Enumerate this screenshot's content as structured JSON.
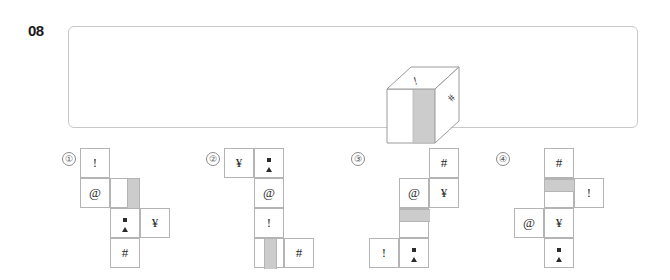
{
  "question": {
    "number": "08",
    "type": "cube-net-matching"
  },
  "prompt": {
    "frame": {
      "border_color": "#c8c8c8"
    },
    "cube": {
      "name": "isometric-cube",
      "top_face_symbol": "!",
      "right_face_symbol": "#",
      "front_face_symbol": "",
      "front_face_band_color": "#cccccc",
      "outline_color": "#9a9a9a"
    }
  },
  "options": [
    {
      "label": "①",
      "id": "option-1",
      "cells": [
        {
          "row": 0,
          "col": 0,
          "symbol": "!"
        },
        {
          "row": 1,
          "col": 0,
          "symbol": "@"
        },
        {
          "row": 1,
          "col": 1,
          "symbol": "",
          "band": "vert-right"
        },
        {
          "row": 2,
          "col": 1,
          "symbol": "dotbar"
        },
        {
          "row": 2,
          "col": 2,
          "symbol": "¥"
        },
        {
          "row": 3,
          "col": 1,
          "symbol": "#"
        }
      ]
    },
    {
      "label": "②",
      "id": "option-2",
      "cells": [
        {
          "row": 0,
          "col": 0,
          "symbol": "¥"
        },
        {
          "row": 0,
          "col": 1,
          "symbol": "dotbar"
        },
        {
          "row": 1,
          "col": 1,
          "symbol": "@"
        },
        {
          "row": 2,
          "col": 1,
          "symbol": "!"
        },
        {
          "row": 3,
          "col": 1,
          "symbol": "",
          "band": "vert-mid"
        },
        {
          "row": 3,
          "col": 2,
          "symbol": "#"
        }
      ]
    },
    {
      "label": "③",
      "id": "option-3",
      "cells": [
        {
          "row": 0,
          "col": 2,
          "symbol": "#"
        },
        {
          "row": 1,
          "col": 1,
          "symbol": "@"
        },
        {
          "row": 1,
          "col": 2,
          "symbol": "¥"
        },
        {
          "row": 2,
          "col": 1,
          "symbol": "",
          "band": "horz-top"
        },
        {
          "row": 3,
          "col": 0,
          "symbol": "!"
        },
        {
          "row": 3,
          "col": 1,
          "symbol": "dotbar"
        }
      ]
    },
    {
      "label": "④",
      "id": "option-4",
      "cells": [
        {
          "row": 0,
          "col": 1,
          "symbol": "#"
        },
        {
          "row": 1,
          "col": 1,
          "symbol": "",
          "band": "horz-top"
        },
        {
          "row": 1,
          "col": 2,
          "symbol": "!"
        },
        {
          "row": 2,
          "col": 0,
          "symbol": "@"
        },
        {
          "row": 2,
          "col": 1,
          "symbol": "¥"
        },
        {
          "row": 3,
          "col": 1,
          "symbol": "dotbar"
        }
      ]
    }
  ],
  "colors": {
    "ink": "#2b2b2b",
    "cell_border": "#b4b4b4",
    "shade": "#cccccc",
    "frame_border": "#c8c8c8"
  }
}
